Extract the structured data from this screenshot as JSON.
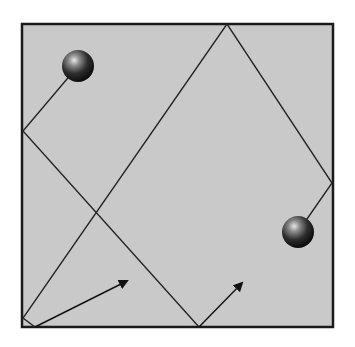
{
  "diagram": {
    "colors": {
      "background": "#ffffff",
      "box_fill": "#c9c9c9",
      "box_border": "#1a1a1a",
      "path_line": "#262626",
      "arrow": "#111111"
    },
    "box": {
      "x": 22,
      "y": 24,
      "width": 311,
      "height": 303
    },
    "balls": [
      {
        "id": "ball-left",
        "cx": 78,
        "cy": 66,
        "r": 16
      },
      {
        "id": "ball-right",
        "cx": 298,
        "cy": 232,
        "r": 16
      }
    ],
    "paths": [
      {
        "id": "trajectory-left-ball",
        "points": [
          [
            78,
            66
          ],
          [
            23,
            131
          ],
          [
            199,
            327
          ]
        ],
        "arrow": {
          "from": [
            199,
            327
          ],
          "to": [
            242,
            283
          ]
        }
      },
      {
        "id": "trajectory-right-ball",
        "points": [
          [
            298,
            232
          ],
          [
            332,
            183
          ],
          [
            227,
            24
          ],
          [
            23,
            318
          ],
          [
            35,
            327
          ]
        ],
        "arrow": {
          "from": [
            35,
            327
          ],
          "to": [
            127,
            281
          ]
        }
      }
    ]
  }
}
